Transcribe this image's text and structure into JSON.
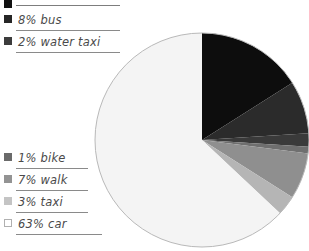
{
  "chart_data": {
    "type": "pie",
    "title": "",
    "units": "percent",
    "legend_position": "left",
    "start_angle_deg": 0,
    "direction": "clockwise",
    "categories": [
      "subway",
      "bus",
      "water taxi",
      "bike",
      "walk",
      "taxi",
      "car"
    ],
    "values": [
      16,
      8,
      2,
      1,
      7,
      3,
      63
    ],
    "labels": [
      "",
      "8% bus",
      "2% water taxi",
      "1% bike",
      "7% walk",
      "3% taxi",
      "63% car"
    ],
    "colors": [
      "#0d0d0d",
      "#2b2b2b",
      "#3a3a3a",
      "#6f6f6f",
      "#8f8f8f",
      "#b5b5b5",
      "#f4f4f4"
    ],
    "slices": [
      {
        "label": "",
        "value": 16,
        "color": "#0d0d0d",
        "cropped_label": true
      },
      {
        "label": "8% bus",
        "value": 8,
        "color": "#2b2b2b"
      },
      {
        "label": "2% water taxi",
        "value": 2,
        "color": "#3a3a3a"
      },
      {
        "label": "1% bike",
        "value": 1,
        "color": "#6f6f6f"
      },
      {
        "label": "7% walk",
        "value": 7,
        "color": "#8f8f8f"
      },
      {
        "label": "3% taxi",
        "value": 3,
        "color": "#b5b5b5"
      },
      {
        "label": "63% car",
        "value": 63,
        "color": "#f4f4f4"
      }
    ],
    "outline_color": "#b9b9b9"
  },
  "legend": {
    "top_items": [
      {
        "label": "",
        "swatch": "#111111",
        "cropped": true
      },
      {
        "label": "8% bus",
        "swatch": "#262626"
      },
      {
        "label": "2% water taxi",
        "swatch": "#3c3c3c"
      }
    ],
    "bottom_items": [
      {
        "label": "1% bike",
        "swatch": "#6a6a6a"
      },
      {
        "label": "7% walk",
        "swatch": "#939393"
      },
      {
        "label": "3% taxi",
        "swatch": "#c4c4c4"
      },
      {
        "label": "63% car",
        "swatch": "#ffffff"
      }
    ]
  },
  "geometry": {
    "center_x": 202,
    "center_y": 140,
    "radius": 107
  }
}
